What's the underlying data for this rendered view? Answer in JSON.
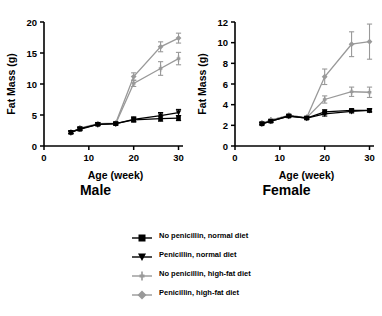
{
  "figure": {
    "panels": [
      {
        "caption": "Male",
        "ylabel": "Fat Mass (g)",
        "xlabel": "Age (week)",
        "yticks": [
          "0",
          "5",
          "10",
          "15",
          "20"
        ],
        "xticks": [
          "0",
          "10",
          "20",
          "30"
        ]
      },
      {
        "caption": "Female",
        "ylabel": "Fat Mass (g)",
        "xlabel": "Age (week)",
        "yticks": [
          "0",
          "2",
          "4",
          "6",
          "8",
          "10",
          "12"
        ],
        "xticks": [
          "0",
          "10",
          "20",
          "30"
        ]
      }
    ]
  },
  "legend": {
    "entries": [
      {
        "label": "No penicillin, normal diet",
        "marker": "square-icon",
        "color": "#000000"
      },
      {
        "label": "Penicillin, normal diet",
        "marker": "triangle-down-icon",
        "color": "#000000"
      },
      {
        "label": "No penicillin, high-fat diet",
        "marker": "plus-icon",
        "color": "#999999"
      },
      {
        "label": "Penicillin, high-fat diet",
        "marker": "diamond-icon",
        "color": "#999999"
      }
    ]
  },
  "colors": {
    "black": "#000000",
    "gray": "#999999",
    "axis": "#000000",
    "background": "#ffffff"
  },
  "chart_data": [
    {
      "type": "line",
      "title": "Male",
      "xlabel": "Age (week)",
      "ylabel": "Fat Mass (g)",
      "xlim": [
        0,
        31
      ],
      "ylim": [
        0,
        20
      ],
      "xticks": [
        0,
        10,
        20,
        30
      ],
      "yticks": [
        0,
        5,
        10,
        15,
        20
      ],
      "grid": false,
      "legend_position": "below-figure",
      "x": [
        6,
        8,
        12,
        16,
        20,
        26,
        30
      ],
      "series": [
        {
          "name": "No penicillin, normal diet",
          "color": "#000000",
          "marker": "square",
          "values": [
            2.2,
            2.7,
            3.5,
            3.6,
            4.2,
            4.4,
            4.5
          ],
          "errors": [
            0.2,
            0.2,
            0.2,
            0.2,
            0.3,
            0.4,
            0.4
          ]
        },
        {
          "name": "Penicillin, normal diet",
          "color": "#000000",
          "marker": "triangle-down",
          "values": [
            2.2,
            2.8,
            3.5,
            3.6,
            4.3,
            4.9,
            5.4
          ],
          "errors": [
            0.2,
            0.2,
            0.2,
            0.2,
            0.4,
            0.5,
            0.5
          ]
        },
        {
          "name": "No penicillin, high-fat diet",
          "color": "#999999",
          "marker": "plus",
          "values": [
            2.2,
            2.8,
            3.5,
            3.6,
            10.1,
            12.5,
            14.1
          ],
          "errors": [
            0.2,
            0.2,
            0.2,
            0.2,
            0.5,
            1.1,
            1.0
          ]
        },
        {
          "name": "Penicillin, high-fat diet",
          "color": "#999999",
          "marker": "diamond",
          "values": [
            2.2,
            2.9,
            3.6,
            3.7,
            11.2,
            16.0,
            17.4
          ],
          "errors": [
            0.2,
            0.2,
            0.2,
            0.2,
            0.6,
            0.8,
            0.8
          ]
        }
      ]
    },
    {
      "type": "line",
      "title": "Female",
      "xlabel": "Age (week)",
      "ylabel": "Fat Mass (g)",
      "xlim": [
        0,
        31
      ],
      "ylim": [
        0,
        12
      ],
      "xticks": [
        0,
        10,
        20,
        30
      ],
      "yticks": [
        0,
        2,
        4,
        6,
        8,
        10,
        12
      ],
      "grid": false,
      "legend_position": "below-figure",
      "x": [
        6,
        8,
        12,
        16,
        20,
        26,
        30
      ],
      "series": [
        {
          "name": "No penicillin, normal diet",
          "color": "#000000",
          "marker": "square",
          "values": [
            2.15,
            2.4,
            2.9,
            2.7,
            3.3,
            3.45,
            3.45
          ],
          "errors": [
            0.1,
            0.1,
            0.1,
            0.1,
            0.2,
            0.15,
            0.15
          ]
        },
        {
          "name": "Penicillin, normal diet",
          "color": "#000000",
          "marker": "triangle-down",
          "values": [
            2.15,
            2.4,
            2.9,
            2.7,
            3.1,
            3.35,
            3.45
          ],
          "errors": [
            0.1,
            0.1,
            0.1,
            0.1,
            0.2,
            0.15,
            0.15
          ]
        },
        {
          "name": "No penicillin, high-fat diet",
          "color": "#999999",
          "marker": "plus",
          "values": [
            2.2,
            2.5,
            2.95,
            2.75,
            4.5,
            5.25,
            5.2
          ],
          "errors": [
            0.1,
            0.1,
            0.1,
            0.1,
            0.35,
            0.45,
            0.5
          ]
        },
        {
          "name": "Penicillin, high-fat diet",
          "color": "#999999",
          "marker": "diamond",
          "values": [
            2.2,
            2.5,
            2.95,
            2.75,
            6.7,
            9.85,
            10.1
          ],
          "errors": [
            0.1,
            0.1,
            0.1,
            0.1,
            0.75,
            1.2,
            1.7
          ]
        }
      ]
    }
  ]
}
